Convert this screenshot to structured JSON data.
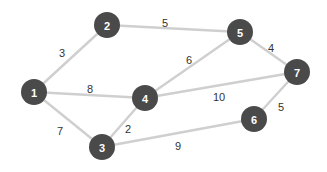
{
  "diagram": {
    "type": "weighted-undirected-graph",
    "node_color": "#4a4a4a",
    "node_text_color": "#ffffff",
    "edge_color": "#cfcfcf",
    "nodes": [
      {
        "id": "1",
        "label": "1",
        "x": 34,
        "y": 92
      },
      {
        "id": "2",
        "label": "2",
        "x": 107,
        "y": 25
      },
      {
        "id": "3",
        "label": "3",
        "x": 102,
        "y": 147
      },
      {
        "id": "4",
        "label": "4",
        "x": 145,
        "y": 98
      },
      {
        "id": "5",
        "label": "5",
        "x": 240,
        "y": 32
      },
      {
        "id": "6",
        "label": "6",
        "x": 254,
        "y": 119
      },
      {
        "id": "7",
        "label": "7",
        "x": 297,
        "y": 72
      }
    ],
    "edges": [
      {
        "from": "1",
        "to": "2",
        "weight": "3",
        "lx": 62,
        "ly": 53
      },
      {
        "from": "2",
        "to": "5",
        "weight": "5",
        "lx": 165,
        "ly": 23
      },
      {
        "from": "1",
        "to": "4",
        "weight": "8",
        "lx": 90,
        "ly": 89
      },
      {
        "from": "4",
        "to": "5",
        "weight": "6",
        "lx": 189,
        "ly": 60
      },
      {
        "from": "5",
        "to": "7",
        "weight": "4",
        "lx": 271,
        "ly": 48
      },
      {
        "from": "4",
        "to": "7",
        "weight": "10",
        "lx": 219,
        "ly": 97
      },
      {
        "from": "1",
        "to": "3",
        "weight": "7",
        "lx": 60,
        "ly": 131
      },
      {
        "from": "3",
        "to": "4",
        "weight": "2",
        "lx": 128,
        "ly": 129
      },
      {
        "from": "3",
        "to": "6",
        "weight": "9",
        "lx": 178,
        "ly": 146
      },
      {
        "from": "6",
        "to": "7",
        "weight": "5",
        "lx": 281,
        "ly": 107
      }
    ]
  }
}
